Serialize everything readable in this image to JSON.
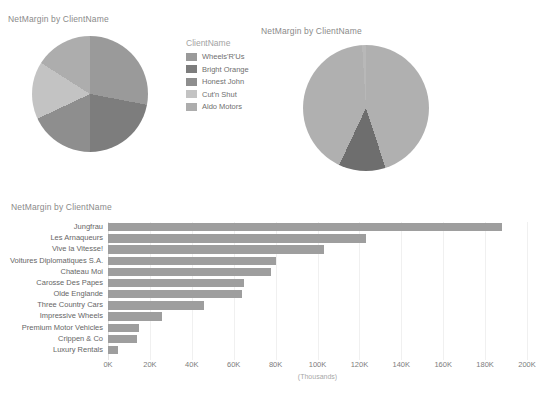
{
  "page": {
    "background": "#ffffff",
    "bar_color": "#9e9e9e",
    "grid_color": "#f0f0f0"
  },
  "pie_left": {
    "title": "NetMargin by ClientName",
    "legend_title": "ClientName"
  },
  "pie_right": {
    "title": "NetMargin by ClientName",
    "legend_title": "ClientName"
  },
  "bar_panel": {
    "title": "NetMargin by ClientName"
  },
  "chart_data": [
    {
      "type": "pie",
      "title": "NetMargin by ClientName",
      "legend_title": "ClientName",
      "legend_position": "right",
      "categories": [
        "Wheels'R'Us",
        "Bright Orange",
        "Honest John",
        "Cut'n Shut",
        "Aldo Motors"
      ],
      "values": [
        28,
        22,
        18,
        16,
        16
      ],
      "colors": [
        "#9a9a9a",
        "#7d7d7d",
        "#8e8e8e",
        "#c3c3c3",
        "#adadad"
      ]
    },
    {
      "type": "pie",
      "title": "NetMargin by ClientName",
      "legend_title": "ClientName",
      "legend_position": "right",
      "categories": [
        "Costa Del Speed",
        "Karz",
        "Smooth Riders",
        "Rocky Riding"
      ],
      "values": [
        45,
        12,
        42,
        1
      ],
      "colors": [
        "#b0b0b0",
        "#6e6e6e",
        "#b0b0b0",
        "#b8b8b8"
      ]
    },
    {
      "type": "bar",
      "orientation": "horizontal",
      "title": "NetMargin by ClientName",
      "xlabel": "(Thousands)",
      "ylabel": "",
      "xlim": [
        0,
        200
      ],
      "grid": true,
      "xticks": [
        0,
        20,
        40,
        60,
        80,
        100,
        120,
        140,
        160,
        180,
        200
      ],
      "xtick_labels": [
        "0K",
        "20K",
        "40K",
        "60K",
        "80K",
        "100K",
        "120K",
        "140K",
        "160K",
        "180K",
        "200K"
      ],
      "categories": [
        "Jungfrau",
        "Les Arnaqueurs",
        "Vive la Vitesse!",
        "Voitures Diplomatiques S.A.",
        "Chateau Moi",
        "Carosse Des Papes",
        "Olde Englande",
        "Three Country Cars",
        "Impressive Wheels",
        "Premium Motor Vehicles",
        "Crippen & Co",
        "Luxury Rentals"
      ],
      "values": [
        188,
        123,
        103,
        80,
        78,
        65,
        64,
        46,
        26,
        15,
        14,
        5
      ]
    }
  ]
}
